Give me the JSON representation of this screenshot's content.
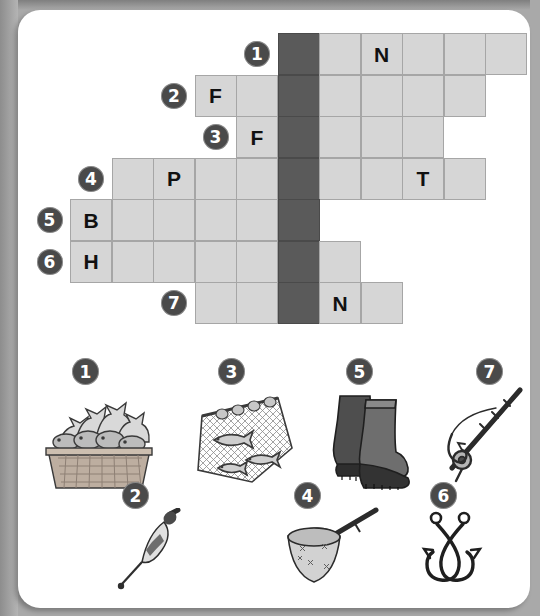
{
  "worksheet": {
    "title": "Fishing crossword puzzle",
    "accent_dark": "#5a5a5a",
    "cell_fill": "#d6d6d6",
    "cell_border": "#a6a6a6",
    "badge_fill": "#4a4a4a",
    "page_background": "#a9a9a9",
    "card_background": "#ffffff"
  },
  "grid": {
    "rows": 7,
    "columns": 12,
    "cell_size": 42,
    "dark_column_index": 5,
    "row_definitions": [
      {
        "number": "1",
        "badge_col": 4,
        "first_col": 5,
        "last_col": 10,
        "letters": {
          "7": "N"
        }
      },
      {
        "number": "2",
        "badge_col": 2,
        "first_col": 3,
        "last_col": 9,
        "letters": {
          "3": "F"
        }
      },
      {
        "number": "3",
        "badge_col": 3,
        "first_col": 4,
        "last_col": 8,
        "letters": {
          "4": "F"
        }
      },
      {
        "number": "4",
        "badge_col": 0,
        "first_col": 1,
        "last_col": 9,
        "letters": {
          "2": "P",
          "8": "T"
        }
      },
      {
        "number": "5",
        "badge_col": -1,
        "first_col": 0,
        "last_col": 5,
        "letters": {
          "0": "B"
        }
      },
      {
        "number": "6",
        "badge_col": -1,
        "first_col": 0,
        "last_col": 6,
        "letters": {
          "0": "H"
        }
      },
      {
        "number": "7",
        "badge_col": 2,
        "first_col": 3,
        "last_col": 7,
        "letters": {
          "6": "N"
        }
      }
    ]
  },
  "pictures": [
    {
      "number": "1",
      "name": "basket-of-fish",
      "label": "basket of fish"
    },
    {
      "number": "2",
      "name": "fishing-float",
      "label": "fishing float"
    },
    {
      "number": "3",
      "name": "keep-net-with-fish",
      "label": "keep net with fish"
    },
    {
      "number": "4",
      "name": "landing-net",
      "label": "landing net"
    },
    {
      "number": "5",
      "name": "rubber-boots",
      "label": "rubber boots"
    },
    {
      "number": "6",
      "name": "fish-hooks",
      "label": "crossed fish hooks"
    },
    {
      "number": "7",
      "name": "fishing-rod",
      "label": "fishing rod and reel"
    }
  ]
}
